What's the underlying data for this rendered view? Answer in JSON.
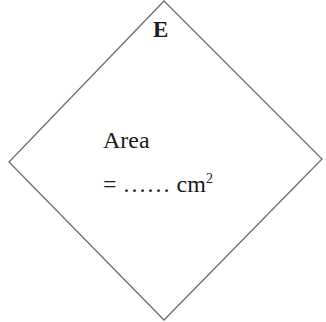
{
  "diagram": {
    "shape": "square rotated 45deg (rhombus)",
    "vertices": [
      [
        164,
        1
      ],
      [
        322,
        159
      ],
      [
        164,
        320
      ],
      [
        9,
        162
      ]
    ],
    "stroke_color": "#6e6e6e",
    "label": "E",
    "area_label": "Area",
    "area_prefix": "= ",
    "area_blank": "……",
    "area_unit": "cm",
    "area_unit_exp": "2"
  }
}
